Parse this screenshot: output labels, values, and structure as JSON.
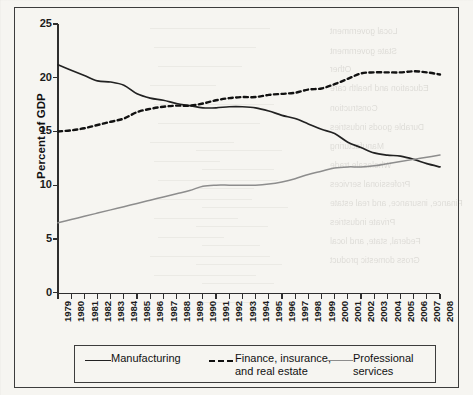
{
  "figure": {
    "kind": "scanned-line-chart",
    "frame_color": "#3d3d3d",
    "background_color": "#f6f5f1"
  },
  "axes": {
    "y_title": "Percent of GDP",
    "y_ticks": [
      "0",
      "5",
      "10",
      "15",
      "20",
      "25"
    ],
    "x_ticks": [
      "1979",
      "1980",
      "1981",
      "1982",
      "1983",
      "1984",
      "1985",
      "1986",
      "1987",
      "1988",
      "1989",
      "1990",
      "1991",
      "1992",
      "1993",
      "1994",
      "1995",
      "1996",
      "1997",
      "1998",
      "1999",
      "2000",
      "2001",
      "2002",
      "2003",
      "2004",
      "2005",
      "2006",
      "2007",
      "2008"
    ]
  },
  "legend": {
    "items": [
      {
        "label": "Manufacturing",
        "style": "solid",
        "color": "#222222"
      },
      {
        "label": "Finance, insurance,\nand real estate",
        "style": "dashed",
        "color": "#111111"
      },
      {
        "label": "Professional services",
        "style": "solid",
        "color": "#8d8d8d"
      }
    ]
  },
  "bleed_through": {
    "note": "faint mirrored text and table rules bleeding from the reverse page",
    "texts": [
      {
        "text": "Local government",
        "x": 330,
        "y": 26
      },
      {
        "text": "State government",
        "x": 330,
        "y": 46
      },
      {
        "text": "Other",
        "x": 330,
        "y": 64
      },
      {
        "text": "Education and health care",
        "x": 330,
        "y": 83
      },
      {
        "text": "Construction",
        "x": 330,
        "y": 103
      },
      {
        "text": "Durable goods industries",
        "x": 330,
        "y": 122
      },
      {
        "text": "Manufacturing",
        "x": 330,
        "y": 141
      },
      {
        "text": "Wholesale trade",
        "x": 330,
        "y": 160
      },
      {
        "text": "Professional services",
        "x": 330,
        "y": 179
      },
      {
        "text": "Finance, insurance, and real estate",
        "x": 330,
        "y": 198
      },
      {
        "text": "Private industries",
        "x": 330,
        "y": 217
      },
      {
        "text": "Federal, state, and local",
        "x": 330,
        "y": 236
      },
      {
        "text": "Gross domestic product",
        "x": 330,
        "y": 255
      }
    ]
  },
  "chart_data": {
    "type": "line",
    "title": "",
    "xlabel": "",
    "ylabel": "Percent of GDP",
    "ylim": [
      0,
      25
    ],
    "ytick_step": 5,
    "grid": false,
    "legend_position": "bottom",
    "x": [
      1979,
      1980,
      1981,
      1982,
      1983,
      1984,
      1985,
      1986,
      1987,
      1988,
      1989,
      1990,
      1991,
      1992,
      1993,
      1994,
      1995,
      1996,
      1997,
      1998,
      1999,
      2000,
      2001,
      2002,
      2003,
      2004,
      2005,
      2006,
      2007,
      2008
    ],
    "series": [
      {
        "name": "Manufacturing",
        "style": "solid",
        "color": "#222222",
        "values": [
          21.2,
          20.7,
          20.2,
          19.7,
          19.6,
          19.3,
          18.5,
          18.1,
          17.9,
          17.6,
          17.4,
          17.2,
          17.2,
          17.3,
          17.3,
          17.2,
          16.9,
          16.5,
          16.2,
          15.7,
          15.2,
          14.8,
          14.0,
          13.5,
          13.0,
          12.8,
          12.7,
          12.4,
          12.0,
          11.7
        ]
      },
      {
        "name": "Finance, insurance, and real estate",
        "style": "dashed",
        "color": "#111111",
        "values": [
          15.0,
          15.1,
          15.3,
          15.6,
          15.9,
          16.2,
          16.8,
          17.1,
          17.3,
          17.4,
          17.4,
          17.6,
          17.9,
          18.1,
          18.2,
          18.2,
          18.4,
          18.5,
          18.6,
          18.9,
          19.0,
          19.4,
          19.9,
          20.4,
          20.5,
          20.5,
          20.5,
          20.6,
          20.5,
          20.3
        ]
      },
      {
        "name": "Professional services",
        "style": "solid",
        "color": "#8d8d8d",
        "values": [
          6.5,
          6.8,
          7.1,
          7.4,
          7.7,
          8.0,
          8.3,
          8.6,
          8.9,
          9.2,
          9.5,
          9.9,
          10.0,
          10.0,
          10.0,
          10.0,
          10.1,
          10.3,
          10.6,
          11.0,
          11.3,
          11.6,
          11.7,
          11.7,
          11.8,
          12.0,
          12.2,
          12.4,
          12.6,
          12.8
        ]
      }
    ]
  }
}
